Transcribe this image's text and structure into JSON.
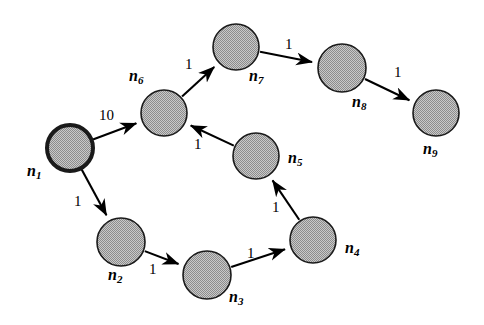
{
  "figure": {
    "type": "directed-weighted-graph-diagram",
    "background_color": "#ffffff",
    "node_fill_color": "#a8a8a8",
    "node_stroke_color": "#1a1a1a",
    "edge_color": "#000000",
    "text_color": "#000000",
    "width": 484,
    "height": 325
  },
  "graph_data": {
    "type": "diagram",
    "directed": true,
    "weighted": true,
    "start_node": "n1",
    "nodes": [
      {
        "id": "n1",
        "label": "n",
        "sub": "1",
        "cx": 70,
        "cy": 148,
        "r": 23,
        "stroke_width": 4,
        "label_x": 27,
        "label_y": 163
      },
      {
        "id": "n2",
        "label": "n",
        "sub": "2",
        "cx": 121,
        "cy": 242,
        "r": 24,
        "stroke_width": 1.6,
        "label_x": 108,
        "label_y": 267
      },
      {
        "id": "n3",
        "label": "n",
        "sub": "3",
        "cx": 207,
        "cy": 275,
        "r": 24,
        "stroke_width": 1.6,
        "label_x": 229,
        "label_y": 289
      },
      {
        "id": "n4",
        "label": "n",
        "sub": "4",
        "cx": 313,
        "cy": 240,
        "r": 23,
        "stroke_width": 1.6,
        "label_x": 345,
        "label_y": 240
      },
      {
        "id": "n5",
        "label": "n",
        "sub": "5",
        "cx": 256,
        "cy": 156,
        "r": 23,
        "stroke_width": 1.6,
        "label_x": 288,
        "label_y": 150
      },
      {
        "id": "n6",
        "label": "n",
        "sub": "6",
        "cx": 164,
        "cy": 113,
        "r": 23,
        "stroke_width": 1.6,
        "label_x": 129,
        "label_y": 68
      },
      {
        "id": "n7",
        "label": "n",
        "sub": "7",
        "cx": 236,
        "cy": 47,
        "r": 23,
        "stroke_width": 1.6,
        "label_x": 249,
        "label_y": 68
      },
      {
        "id": "n8",
        "label": "n",
        "sub": "8",
        "cx": 342,
        "cy": 68,
        "r": 24,
        "stroke_width": 1.6,
        "label_x": 352,
        "label_y": 94
      },
      {
        "id": "n9",
        "label": "n",
        "sub": "9",
        "cx": 436,
        "cy": 113,
        "r": 23,
        "stroke_width": 1.6,
        "label_x": 423,
        "label_y": 141
      }
    ],
    "edges": [
      {
        "id": "e-n1-n6",
        "from": "n1",
        "to": "n6",
        "weight": "10",
        "label_x": 99,
        "label_y": 108
      },
      {
        "id": "e-n1-n2",
        "from": "n1",
        "to": "n2",
        "weight": "1",
        "label_x": 74,
        "label_y": 194
      },
      {
        "id": "e-n2-n3",
        "from": "n2",
        "to": "n3",
        "weight": "1",
        "label_x": 149,
        "label_y": 262
      },
      {
        "id": "e-n3-n4",
        "from": "n3",
        "to": "n4",
        "weight": "1",
        "label_x": 247,
        "label_y": 246
      },
      {
        "id": "e-n4-n5",
        "from": "n4",
        "to": "n5",
        "weight": "1",
        "label_x": 272,
        "label_y": 200
      },
      {
        "id": "e-n5-n6",
        "from": "n5",
        "to": "n6",
        "weight": "1",
        "label_x": 194,
        "label_y": 137
      },
      {
        "id": "e-n6-n7",
        "from": "n6",
        "to": "n7",
        "weight": "1",
        "label_x": 185,
        "label_y": 57
      },
      {
        "id": "e-n7-n8",
        "from": "n7",
        "to": "n8",
        "weight": "1",
        "label_x": 285,
        "label_y": 37
      },
      {
        "id": "e-n8-n9",
        "from": "n8",
        "to": "n9",
        "weight": "1",
        "label_x": 394,
        "label_y": 65
      }
    ]
  }
}
